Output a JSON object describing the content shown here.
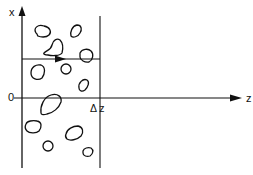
{
  "diagram": {
    "axes": {
      "vertical_label": "x",
      "horizontal_label": "z",
      "origin_label": "0",
      "slab_label": "Δ z"
    },
    "colors": {
      "stroke": "#111111",
      "background": "#ffffff"
    },
    "elements": {
      "slab_left_boundary": "x = 0 plane (vertical axis)",
      "slab_right_boundary": "z = Δz plane",
      "ray": "horizontal line with arrow inside the slab",
      "particles": 11
    }
  }
}
